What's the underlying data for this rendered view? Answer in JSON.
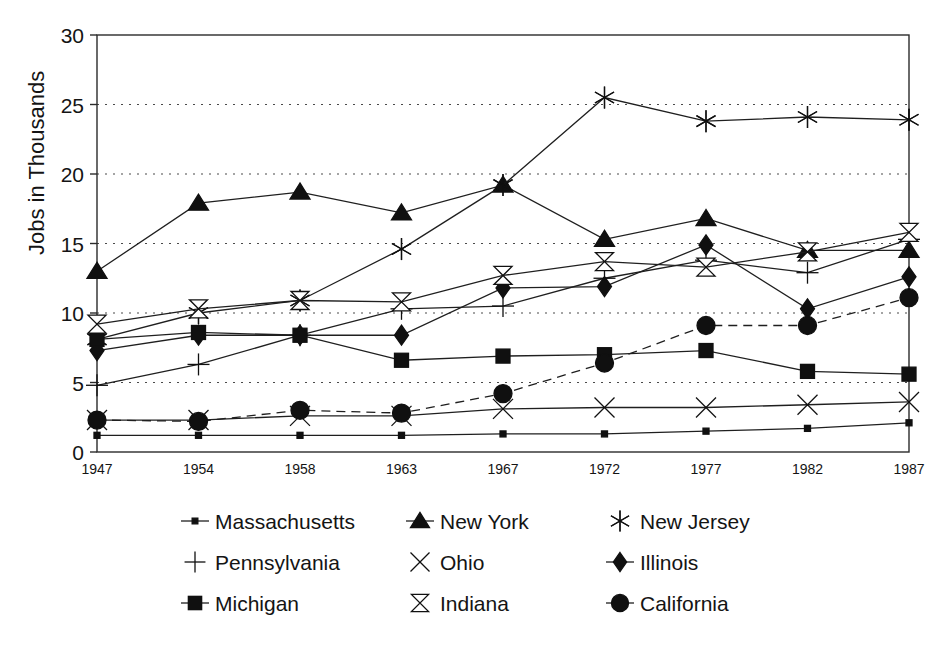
{
  "chart_data": {
    "type": "line",
    "title": "",
    "xlabel": "",
    "ylabel": "Jobs in Thousands",
    "categories": [
      "1947",
      "1954",
      "1958",
      "1963",
      "1967",
      "1972",
      "1977",
      "1982",
      "1987"
    ],
    "xticklabels": [
      "1947",
      "1954",
      "1958",
      "1963",
      "1967",
      "1972",
      "1977",
      "1982",
      "1987"
    ],
    "yticklabels": [
      "0",
      "5",
      "10",
      "15",
      "20",
      "25",
      "30"
    ],
    "yticks": [
      0,
      5,
      10,
      15,
      20,
      25,
      30
    ],
    "ylim": [
      0,
      30
    ],
    "grid": "horizontal-dotted",
    "legend_position": "below-plot",
    "legend_columns": 3,
    "series": [
      {
        "name": "Massachusetts",
        "marker": "small-filled-square",
        "linestyle": "solid",
        "values": [
          1.2,
          1.2,
          1.2,
          1.2,
          1.3,
          1.3,
          1.5,
          1.7,
          2.1
        ]
      },
      {
        "name": "New York",
        "marker": "filled-triangle",
        "linestyle": "solid",
        "values": [
          13.0,
          17.9,
          18.7,
          17.2,
          19.2,
          15.3,
          16.8,
          14.5,
          14.5
        ]
      },
      {
        "name": "New Jersey",
        "marker": "asterisk",
        "linestyle": "solid",
        "values": [
          8.1,
          10.0,
          10.9,
          14.6,
          19.2,
          25.5,
          23.8,
          24.1,
          23.9
        ]
      },
      {
        "name": "Pennsylvania",
        "marker": "plus",
        "linestyle": "solid",
        "values": [
          4.8,
          6.3,
          8.4,
          10.3,
          10.5,
          12.5,
          13.8,
          12.9,
          15.3
        ]
      },
      {
        "name": "Ohio",
        "marker": "x-cross",
        "linestyle": "solid",
        "values": [
          2.3,
          2.3,
          2.6,
          2.6,
          3.1,
          3.2,
          3.2,
          3.4,
          3.6
        ]
      },
      {
        "name": "Illinois",
        "marker": "filled-diamond",
        "linestyle": "solid",
        "values": [
          7.3,
          8.4,
          8.4,
          8.4,
          11.8,
          11.9,
          14.9,
          10.3,
          12.6
        ]
      },
      {
        "name": "Michigan",
        "marker": "filled-square",
        "linestyle": "solid",
        "values": [
          8.1,
          8.6,
          8.4,
          6.6,
          6.9,
          7.0,
          7.3,
          5.8,
          5.6
        ]
      },
      {
        "name": "Indiana",
        "marker": "hourglass",
        "linestyle": "solid",
        "values": [
          9.2,
          10.3,
          10.9,
          10.8,
          12.7,
          13.7,
          13.3,
          14.4,
          15.8
        ]
      },
      {
        "name": "California",
        "marker": "filled-circle",
        "linestyle": "dashed",
        "values": [
          2.3,
          2.2,
          3.0,
          2.8,
          4.2,
          6.4,
          9.1,
          9.1,
          11.1
        ]
      }
    ]
  },
  "legend": {
    "items": [
      {
        "label": "Massachusetts",
        "marker": "small-filled-square"
      },
      {
        "label": "New York",
        "marker": "filled-triangle"
      },
      {
        "label": "New Jersey",
        "marker": "asterisk"
      },
      {
        "label": "Pennsylvania",
        "marker": "plus"
      },
      {
        "label": "Ohio",
        "marker": "x-cross"
      },
      {
        "label": "Illinois",
        "marker": "filled-diamond"
      },
      {
        "label": "Michigan",
        "marker": "filled-square"
      },
      {
        "label": "Indiana",
        "marker": "hourglass"
      },
      {
        "label": "California",
        "marker": "filled-circle"
      }
    ]
  },
  "colors": {
    "ink": "#101010",
    "frame": "#2b2b2b",
    "grid": "#4a4a4a",
    "background": "#ffffff"
  }
}
